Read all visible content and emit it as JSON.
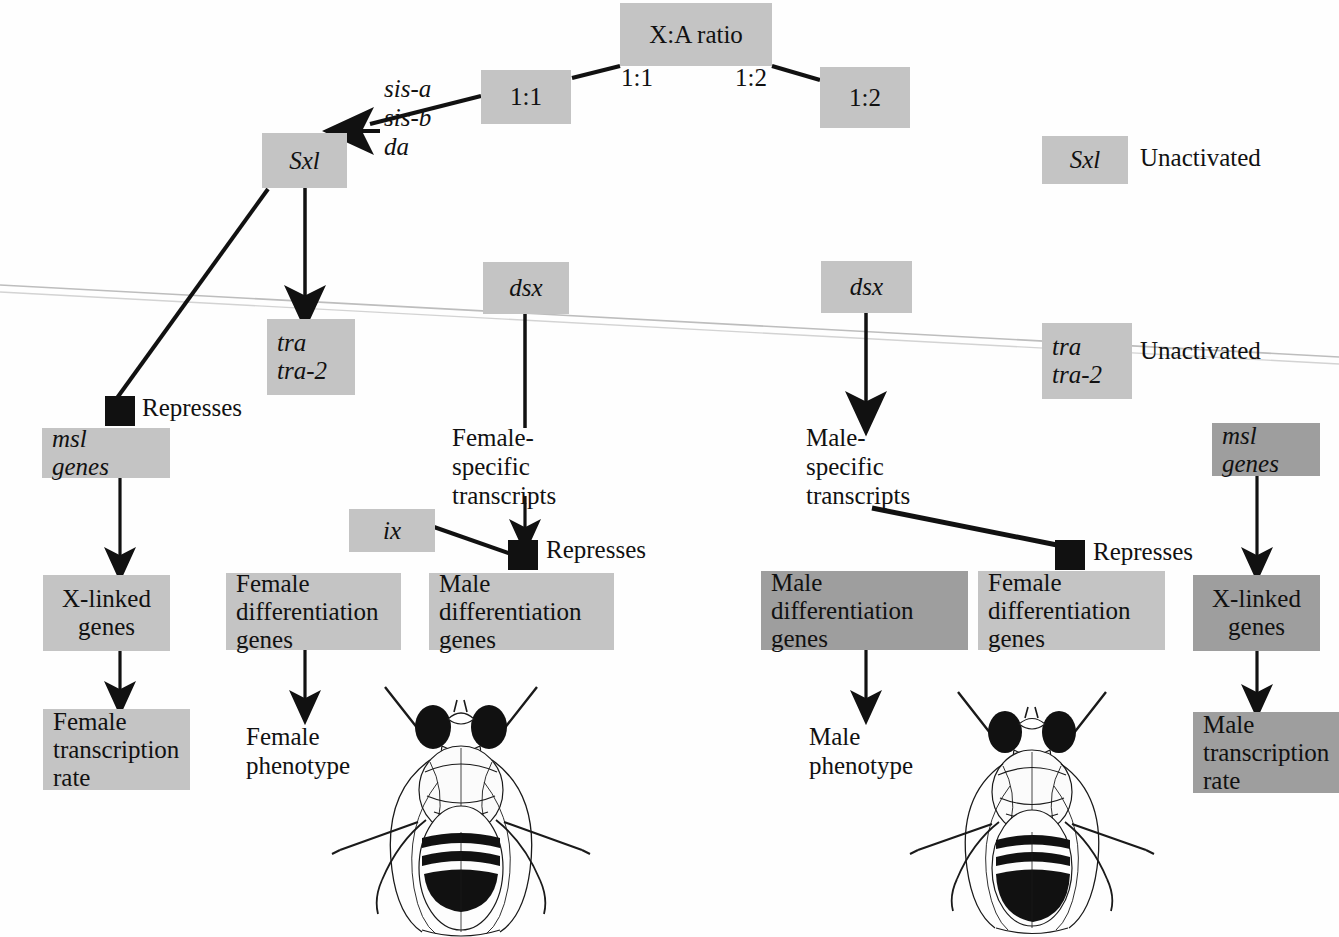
{
  "diagram": {
    "colors": {
      "box_light": "#c4c4c4",
      "box_dark": "#9e9e9e",
      "repressor": "#111111",
      "background": "#fefefe",
      "line": "#111111",
      "scan_artifact": "#b9b9b9"
    },
    "boxes": [
      {
        "id": "xa_ratio",
        "label": "X:A ratio",
        "x": 620,
        "y": 3,
        "w": 152,
        "h": 63,
        "shade": "light",
        "italic": false,
        "align": "center"
      },
      {
        "id": "ratio_1_1",
        "label": "1:1",
        "x": 481,
        "y": 70,
        "w": 90,
        "h": 54,
        "shade": "light",
        "italic": false,
        "align": "center"
      },
      {
        "id": "ratio_1_2",
        "label": "1:2",
        "x": 820,
        "y": 67,
        "w": 90,
        "h": 61,
        "shade": "light",
        "italic": false,
        "align": "center"
      },
      {
        "id": "sxl_active",
        "label": "Sxl",
        "x": 262,
        "y": 133,
        "w": 85,
        "h": 55,
        "shade": "light",
        "italic": true,
        "align": "center"
      },
      {
        "id": "sxl_unactivated",
        "label": "Sxl",
        "x": 1042,
        "y": 136,
        "w": 86,
        "h": 48,
        "shade": "light",
        "italic": true,
        "align": "center"
      },
      {
        "id": "tra_active",
        "label": "tra\ntra-2",
        "x": 267,
        "y": 319,
        "w": 88,
        "h": 76,
        "shade": "light",
        "italic": true,
        "align": "left"
      },
      {
        "id": "tra_unactivated",
        "label": "tra\ntra-2",
        "x": 1042,
        "y": 323,
        "w": 90,
        "h": 76,
        "shade": "light",
        "italic": true,
        "align": "left"
      },
      {
        "id": "dsx_female",
        "label": "dsx",
        "x": 483,
        "y": 262,
        "w": 86,
        "h": 52,
        "shade": "light",
        "italic": true,
        "align": "center"
      },
      {
        "id": "dsx_male",
        "label": "dsx",
        "x": 821,
        "y": 261,
        "w": 91,
        "h": 52,
        "shade": "light",
        "italic": true,
        "align": "center"
      },
      {
        "id": "ix",
        "label": "ix",
        "x": 349,
        "y": 509,
        "w": 86,
        "h": 43,
        "shade": "light",
        "italic": true,
        "align": "center"
      },
      {
        "id": "msl_female",
        "label": "msl\ngenes",
        "x": 42,
        "y": 428,
        "w": 128,
        "h": 50,
        "shade": "light",
        "italic": false,
        "align": "left"
      },
      {
        "id": "msl_male",
        "label": "msl\ngenes",
        "x": 1212,
        "y": 423,
        "w": 108,
        "h": 53,
        "shade": "dark",
        "italic": false,
        "align": "left"
      },
      {
        "id": "xlinked_female",
        "label": "X-linked\ngenes",
        "x": 43,
        "y": 575,
        "w": 127,
        "h": 76,
        "shade": "light",
        "italic": false,
        "align": "center"
      },
      {
        "id": "xlinked_male",
        "label": "X-linked\ngenes",
        "x": 1193,
        "y": 575,
        "w": 127,
        "h": 76,
        "shade": "dark",
        "italic": false,
        "align": "center"
      },
      {
        "id": "female_diff_left",
        "label": "Female\ndifferentiation\ngenes",
        "x": 226,
        "y": 573,
        "w": 175,
        "h": 77,
        "shade": "light",
        "italic": false,
        "align": "left"
      },
      {
        "id": "male_diff_left",
        "label": "Male\ndifferentiation\ngenes",
        "x": 429,
        "y": 573,
        "w": 185,
        "h": 77,
        "shade": "light",
        "italic": false,
        "align": "left"
      },
      {
        "id": "male_diff_right",
        "label": "Male\ndifferentiation\ngenes",
        "x": 761,
        "y": 571,
        "w": 207,
        "h": 79,
        "shade": "dark",
        "italic": false,
        "align": "left"
      },
      {
        "id": "female_diff_right",
        "label": "Female\ndifferentiation\ngenes",
        "x": 978,
        "y": 571,
        "w": 187,
        "h": 79,
        "shade": "light",
        "italic": false,
        "align": "left"
      },
      {
        "id": "female_transcription",
        "label": "Female\ntranscription\nrate",
        "x": 43,
        "y": 709,
        "w": 147,
        "h": 81,
        "shade": "light",
        "italic": false,
        "align": "left"
      },
      {
        "id": "male_transcription",
        "label": "Male\ntranscription\nrate",
        "x": 1193,
        "y": 712,
        "w": 147,
        "h": 81,
        "shade": "dark",
        "italic": false,
        "align": "left"
      }
    ],
    "labels": [
      {
        "id": "sis_genes",
        "text": "sis-a\nsis-b\nda",
        "x": 384,
        "y": 74,
        "italic": true,
        "size": 25
      },
      {
        "id": "edge_label_1_1",
        "text": "1:1",
        "x": 621,
        "y": 63,
        "italic": false,
        "size": 25
      },
      {
        "id": "edge_label_1_2",
        "text": "1:2",
        "x": 735,
        "y": 63,
        "italic": false,
        "size": 25
      },
      {
        "id": "sxl_unactivated_note",
        "text": "Unactivated",
        "x": 1140,
        "y": 143,
        "italic": false,
        "size": 25
      },
      {
        "id": "tra_unactivated_note",
        "text": "Unactivated",
        "x": 1140,
        "y": 336,
        "italic": false,
        "size": 25
      },
      {
        "id": "represses_left",
        "text": "Represses",
        "x": 142,
        "y": 393,
        "italic": false,
        "size": 25
      },
      {
        "id": "represses_middle",
        "text": "Represses",
        "x": 546,
        "y": 535,
        "italic": false,
        "size": 25
      },
      {
        "id": "represses_right",
        "text": "Represses",
        "x": 1093,
        "y": 537,
        "italic": false,
        "size": 25
      },
      {
        "id": "female_specific",
        "text": "Female-\nspecific\ntranscripts",
        "x": 452,
        "y": 423,
        "italic": false,
        "size": 25
      },
      {
        "id": "male_specific",
        "text": "Male-\nspecific\ntranscripts",
        "x": 806,
        "y": 423,
        "italic": false,
        "size": 25
      },
      {
        "id": "female_phenotype",
        "text": "Female\nphenotype",
        "x": 246,
        "y": 722,
        "italic": false,
        "size": 25
      },
      {
        "id": "male_phenotype",
        "text": "Male\nphenotype",
        "x": 809,
        "y": 722,
        "italic": false,
        "size": 25
      }
    ],
    "repressor_squares": [
      {
        "id": "repressor-left",
        "x": 105,
        "y": 396,
        "w": 30,
        "h": 30
      },
      {
        "id": "repressor-middle",
        "x": 508,
        "y": 540,
        "w": 30,
        "h": 30
      },
      {
        "id": "repressor-right",
        "x": 1055,
        "y": 540,
        "w": 30,
        "h": 30
      }
    ],
    "flies": [
      {
        "id": "female-fly",
        "label": "Drosophila female illustration",
        "x": 330,
        "y": 672,
        "w": 260,
        "h": 262
      },
      {
        "id": "male-fly",
        "label": "Drosophila male illustration",
        "x": 910,
        "y": 680,
        "w": 245,
        "h": 253
      }
    ],
    "connectors": [
      {
        "id": "xa-to-1to1",
        "type": "line",
        "from": "X:A ratio",
        "to": "1:1 box"
      },
      {
        "id": "xa-to-1to2",
        "type": "line",
        "from": "X:A ratio",
        "to": "1:2 box"
      },
      {
        "id": "sis-to-sxl",
        "type": "arrow",
        "from": "sis-a/sis-b/da",
        "to": "Sxl"
      },
      {
        "id": "sxl-to-tra",
        "type": "arrow",
        "from": "Sxl",
        "to": "tra/tra-2"
      },
      {
        "id": "sxl-to-repressor",
        "type": "line",
        "from": "Sxl",
        "to": "Represses (msl genes)"
      },
      {
        "id": "msl-to-xlinked-f",
        "type": "arrow",
        "from": "msl genes",
        "to": "X-linked genes"
      },
      {
        "id": "xlinked-to-rate-f",
        "type": "arrow",
        "from": "X-linked genes",
        "to": "Female transcription rate"
      },
      {
        "id": "femalediff-to-phenotype",
        "type": "arrow",
        "from": "Female differentiation genes",
        "to": "Female phenotype"
      },
      {
        "id": "dsx-f-to-transcripts",
        "type": "arrow",
        "from": "dsx",
        "to": "Female-specific transcripts"
      },
      {
        "id": "transcripts-f-to-repressor",
        "type": "arrow",
        "from": "Female-specific transcripts",
        "to": "Represses"
      },
      {
        "id": "ix-to-repressor",
        "type": "line",
        "from": "ix",
        "to": "Represses"
      },
      {
        "id": "dsx-m-to-transcripts",
        "type": "arrow",
        "from": "dsx",
        "to": "Male-specific transcripts"
      },
      {
        "id": "transcripts-m-to-repressor",
        "type": "line",
        "from": "Male-specific transcripts",
        "to": "Represses"
      },
      {
        "id": "malediff-to-phenotype",
        "type": "arrow",
        "from": "Male differentiation genes",
        "to": "Male phenotype"
      },
      {
        "id": "msl-to-xlinked-m",
        "type": "arrow",
        "from": "msl genes",
        "to": "X-linked genes"
      },
      {
        "id": "xlinked-to-rate-m",
        "type": "arrow",
        "from": "X-linked genes",
        "to": "Male transcription rate"
      }
    ]
  }
}
